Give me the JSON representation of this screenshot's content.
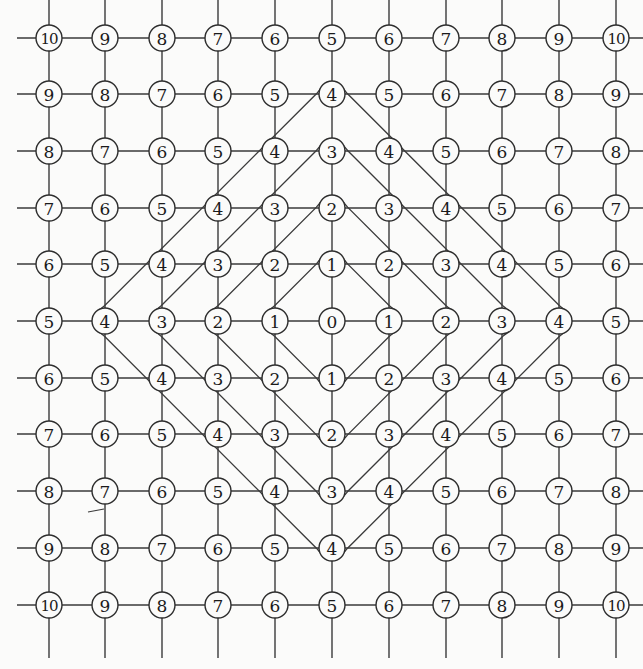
{
  "diagram": {
    "type": "grid-graph-distance",
    "grid_size": 11,
    "center_label": "0",
    "columns_x": [
      49,
      105,
      162,
      218,
      275,
      332,
      389,
      446,
      502,
      559,
      616
    ],
    "rows_y": [
      38,
      94,
      151,
      208,
      264,
      321,
      378,
      434,
      491,
      548,
      605
    ],
    "node_radius": 13,
    "labels": [
      [
        "10",
        "9",
        "8",
        "7",
        "6",
        "5",
        "6",
        "7",
        "8",
        "9",
        "10"
      ],
      [
        "9",
        "8",
        "7",
        "6",
        "5",
        "4",
        "5",
        "6",
        "7",
        "8",
        "9"
      ],
      [
        "8",
        "7",
        "6",
        "5",
        "4",
        "3",
        "4",
        "5",
        "6",
        "7",
        "8"
      ],
      [
        "7",
        "6",
        "5",
        "4",
        "3",
        "2",
        "3",
        "4",
        "5",
        "6",
        "7"
      ],
      [
        "6",
        "5",
        "4",
        "3",
        "2",
        "1",
        "2",
        "3",
        "4",
        "5",
        "6"
      ],
      [
        "5",
        "4",
        "3",
        "2",
        "1",
        "0",
        "1",
        "2",
        "3",
        "4",
        "5"
      ],
      [
        "6",
        "5",
        "4",
        "3",
        "2",
        "1",
        "2",
        "3",
        "4",
        "5",
        "6"
      ],
      [
        "7",
        "6",
        "5",
        "4",
        "3",
        "2",
        "3",
        "4",
        "5",
        "6",
        "7"
      ],
      [
        "8",
        "7",
        "6",
        "5",
        "4",
        "3",
        "4",
        "5",
        "6",
        "7",
        "8"
      ],
      [
        "9",
        "8",
        "7",
        "6",
        "5",
        "4",
        "5",
        "6",
        "7",
        "8",
        "9"
      ],
      [
        "10",
        "9",
        "8",
        "7",
        "6",
        "5",
        "6",
        "7",
        "8",
        "9",
        "10"
      ]
    ],
    "contours": [
      {
        "level": 1,
        "label": "distance 1 loop"
      },
      {
        "level": 2,
        "label": "distance 2 loop"
      },
      {
        "level": 3,
        "label": "distance 3 loop"
      },
      {
        "level": 4,
        "label": "distance 4 loop"
      }
    ],
    "colors": {
      "background": "#fbfbfa",
      "line": "#3a3a3a",
      "node_fill": "#fbfbfa",
      "text": "#1a1a1a"
    }
  }
}
